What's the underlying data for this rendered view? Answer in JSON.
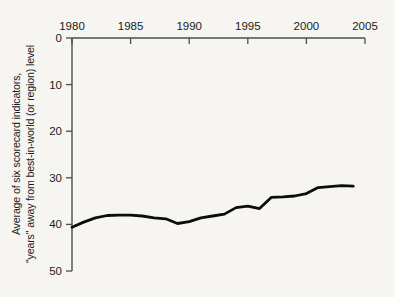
{
  "chart_data": {
    "type": "line",
    "title": "",
    "xlabel": "",
    "ylabel_line1": "Average of six scorecard indicators,",
    "ylabel_line2": "\"years\" away from best-in-world (or region) level",
    "x": [
      1980,
      1981,
      1982,
      1983,
      1984,
      1985,
      1986,
      1987,
      1988,
      1989,
      1990,
      1991,
      1992,
      1993,
      1994,
      1995,
      1996,
      1997,
      1998,
      1999,
      2000,
      2001,
      2002,
      2003,
      2004
    ],
    "values": [
      40.6,
      39.5,
      38.6,
      38.1,
      38.0,
      38.0,
      38.2,
      38.6,
      38.8,
      39.8,
      39.4,
      38.6,
      38.2,
      37.8,
      36.4,
      36.1,
      36.6,
      34.2,
      34.1,
      33.9,
      33.4,
      32.1,
      31.9,
      31.7,
      31.8
    ],
    "x_ticks": [
      1980,
      1985,
      1990,
      1995,
      2000,
      2005
    ],
    "y_ticks": [
      0,
      10,
      20,
      30,
      40,
      50
    ],
    "xlim": [
      1980,
      2005
    ],
    "ylim": [
      0,
      50
    ],
    "y_axis_inverted": true,
    "x_axis_position": "top",
    "grid": false,
    "legend": false,
    "colors": {
      "background": "#f6f5f2",
      "axis": "#4d4d4d",
      "tick_text": "#1b1b1b",
      "series_line": "#0c0c0c"
    }
  }
}
